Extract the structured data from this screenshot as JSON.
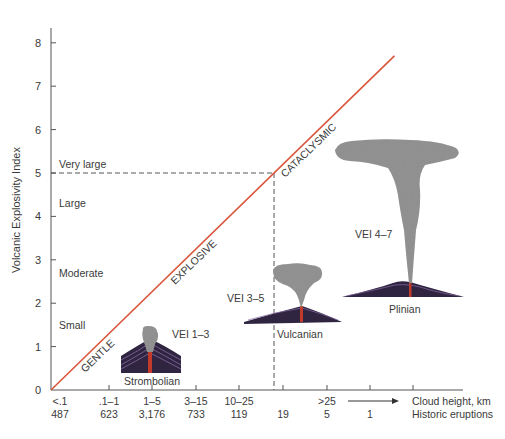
{
  "chart_data": {
    "type": "line",
    "title": "",
    "ylabel": "Volcanic Explosivity Index",
    "ylim": [
      0,
      8
    ],
    "yticks": [
      "0",
      "1",
      "2",
      "3",
      "4",
      "5",
      "6",
      "7",
      "8"
    ],
    "magnitude_labels": [
      {
        "label": "Very large",
        "vei": 5.2
      },
      {
        "label": "Large",
        "vei": 4.3
      },
      {
        "label": "Moderate",
        "vei": 2.7
      },
      {
        "label": "Small",
        "vei": 1.5
      }
    ],
    "x_rows": [
      {
        "name": "Cloud height, km",
        "values": [
          "<.1",
          ".1–1",
          "1–5",
          "3–15",
          "10–25",
          "",
          ">25",
          ""
        ]
      },
      {
        "name": "Historic eruptions",
        "values": [
          "487",
          "623",
          "3,176",
          "733",
          "119",
          "19",
          "5",
          "1"
        ]
      }
    ],
    "trend_line": {
      "from_vei": 0,
      "to_vei": 7.7,
      "color": "#d9553b"
    },
    "trend_labels": [
      "GENTLE",
      "EXPLOSIVE",
      "CATACLYSMIC"
    ],
    "reference": {
      "vei": 5,
      "dashed": true
    },
    "eruption_types": [
      {
        "name": "Strombolian",
        "vei_range": "VEI 1–3"
      },
      {
        "name": "Vulcanian",
        "vei_range": "VEI 3–5"
      },
      {
        "name": "Plinian",
        "vei_range": "VEI 4–7"
      }
    ],
    "grid": false
  }
}
